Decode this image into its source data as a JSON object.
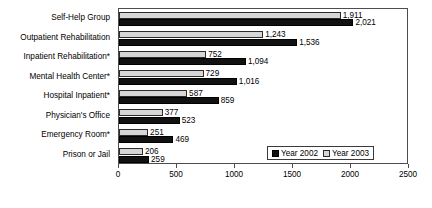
{
  "chart_data": {
    "type": "bar",
    "orientation": "horizontal",
    "title": "",
    "xlabel": "",
    "ylabel": "",
    "xlim": [
      0,
      2500
    ],
    "xticks": [
      0,
      500,
      1000,
      1500,
      2000,
      2500
    ],
    "xtick_labels": [
      "0",
      "500",
      "1000",
      "1500",
      "2000",
      "2500"
    ],
    "grid": false,
    "legend_position": "lower-right-inside",
    "categories": [
      "Self-Help Group",
      "Outpatient Rehabilitation",
      "Inpatient Rehabilitation*",
      "Mental Health Center*",
      "Hospital Inpatient*",
      "Physician's Office",
      "Emergency Room*",
      "Prison or Jail"
    ],
    "series": [
      {
        "name": "Year 2002",
        "color": "#111111",
        "values": [
          2021,
          1536,
          1094,
          1016,
          859,
          523,
          469,
          259
        ],
        "value_labels": [
          "2,021",
          "1,536",
          "1,094",
          "1,016",
          "859",
          "523",
          "469",
          "259"
        ]
      },
      {
        "name": "Year 2003",
        "color": "#d6d6d6",
        "values": [
          1911,
          1243,
          752,
          729,
          587,
          377,
          251,
          206
        ],
        "value_labels": [
          "1,911",
          "1,243",
          "752",
          "729",
          "587",
          "377",
          "251",
          "206"
        ]
      }
    ]
  },
  "legend": {
    "entries": [
      {
        "label": "Year 2002",
        "swatch": "s2002"
      },
      {
        "label": "Year 2003",
        "swatch": "s2003"
      }
    ]
  }
}
